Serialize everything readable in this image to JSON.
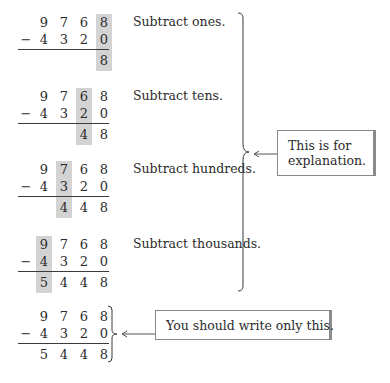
{
  "header_fragment": "",
  "problem": {
    "minuend": [
      "9",
      "7",
      "6",
      "8"
    ],
    "subtrahend": [
      "4",
      "3",
      "2",
      "0"
    ],
    "operator": "−",
    "difference": [
      "5",
      "4",
      "4",
      "8"
    ]
  },
  "steps": [
    {
      "label": "Subtract ones.",
      "highlight_column": 3,
      "result": [
        "",
        "",
        "",
        "8"
      ]
    },
    {
      "label": "Subtract tens.",
      "highlight_column": 2,
      "result": [
        "",
        "",
        "4",
        "8"
      ]
    },
    {
      "label": "Subtract hundreds.",
      "highlight_column": 1,
      "result": [
        "",
        "4",
        "4",
        "8"
      ]
    },
    {
      "label": "Subtract thousands.",
      "highlight_column": 0,
      "result": [
        "5",
        "4",
        "4",
        "8"
      ]
    }
  ],
  "final": {
    "result": [
      "5",
      "4",
      "4",
      "8"
    ]
  },
  "callouts": {
    "explanation": {
      "line1": "This is for",
      "line2": "explanation."
    },
    "write_only": "You should write only this."
  },
  "colors": {
    "highlight": "#d3d3d3",
    "text": "#2b2b2b",
    "rule": "#3a3a3a",
    "callout_border": "#888888"
  }
}
